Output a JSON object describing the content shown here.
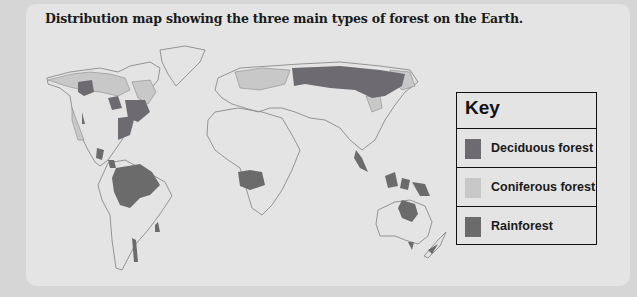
{
  "title": "Distribution map showing the three main types of forest on the Earth.",
  "colors": {
    "background": "#d6d6d6",
    "panel": "#e4e4e4",
    "land_outline": "#8a8a8a",
    "deciduous": "#6e6a72",
    "coniferous": "#c8c8c8",
    "rainforest": "#6b6b6b"
  },
  "key": {
    "title": "Key",
    "items": [
      {
        "label": "Deciduous forest",
        "color": "#6e6a72"
      },
      {
        "label": "Coniferous forest",
        "color": "#c8c8c8"
      },
      {
        "label": "Rainforest",
        "color": "#6b6b6b"
      }
    ]
  }
}
